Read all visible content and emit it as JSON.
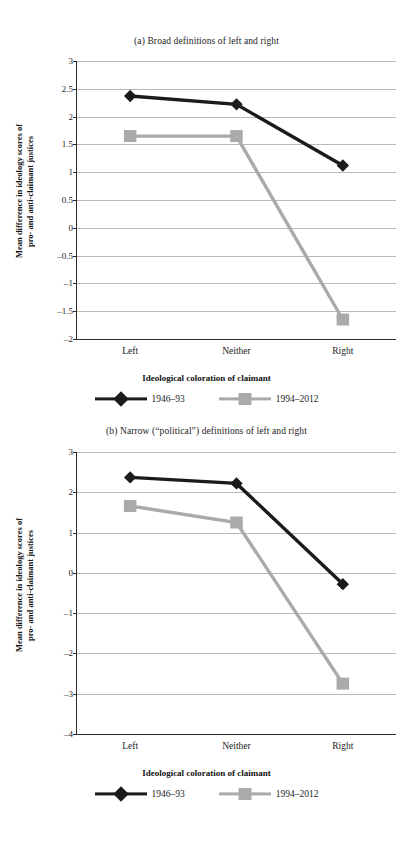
{
  "figure": {
    "x_axis_title": "Ideological coloration of claimant",
    "y_axis_title_line1": "Mean difference in ideology scores of",
    "y_axis_title_line2": "pro- and anti-claimant justices",
    "series_colors": {
      "series1": "#1b1b1b",
      "series2": "#aaaaaa"
    },
    "gridline_color": "#b9b9b9",
    "axis_color": "#2b2b2b"
  },
  "legend": {
    "items": [
      {
        "label": "1946–93",
        "marker": "diamond-marker",
        "color": "#1b1b1b"
      },
      {
        "label": "1994–2012",
        "marker": "square-marker",
        "color": "#aaaaaa"
      }
    ]
  },
  "chart_data": [
    {
      "id": "panel-a",
      "type": "line",
      "title": "(a) Broad definitions of left and right",
      "xlabel": "Ideological coloration of claimant",
      "ylabel": "Mean difference in ideology scores of pro- and anti-claimant justices",
      "categories": [
        "Left",
        "Neither",
        "Right"
      ],
      "ylim": [
        -2,
        3
      ],
      "yticks": [
        "3",
        "2.5",
        "2",
        "1.5",
        "1",
        "0.5",
        "0",
        "–0.5",
        "–1",
        "–1.5",
        "–2"
      ],
      "ytick_values": [
        3,
        2.5,
        2,
        1.5,
        1,
        0.5,
        0,
        -0.5,
        -1,
        -1.5,
        -2
      ],
      "grid": true,
      "legend_position": "bottom",
      "series": [
        {
          "name": "1946–93",
          "marker": "diamond",
          "color": "#1b1b1b",
          "values": [
            2.37,
            2.22,
            1.12
          ]
        },
        {
          "name": "1994–2012",
          "marker": "square",
          "color": "#aaaaaa",
          "values": [
            1.65,
            1.65,
            -1.65
          ]
        }
      ]
    },
    {
      "id": "panel-b",
      "type": "line",
      "title": "(b) Narrow (“political”) definitions of left and right",
      "xlabel": "Ideological coloration of claimant",
      "ylabel": "Mean difference in ideology scores of pro- and anti-claimant justices",
      "categories": [
        "Left",
        "Neither",
        "Right"
      ],
      "ylim": [
        -4,
        3
      ],
      "yticks": [
        "3",
        "2",
        "1",
        "0",
        "–1",
        "–2",
        "–3",
        "–4"
      ],
      "ytick_values": [
        3,
        2,
        1,
        0,
        -1,
        -2,
        -3,
        -4
      ],
      "grid": true,
      "legend_position": "bottom",
      "series": [
        {
          "name": "1946–93",
          "marker": "diamond",
          "color": "#1b1b1b",
          "values": [
            2.37,
            2.22,
            -0.28
          ]
        },
        {
          "name": "1994–2012",
          "marker": "square",
          "color": "#aaaaaa",
          "values": [
            1.66,
            1.25,
            -2.75
          ]
        }
      ]
    }
  ]
}
